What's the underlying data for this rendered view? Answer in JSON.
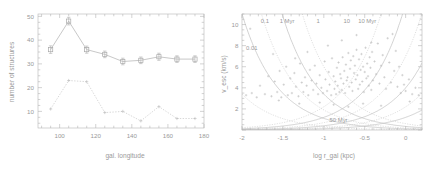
{
  "figure": {
    "background": "#ffffff",
    "line_color": "#b0b0b0",
    "text_color": "#9a9a9a"
  },
  "chart_data": [
    {
      "type": "line",
      "panel": "left",
      "title": "",
      "xlabel": "gal. longitude",
      "ylabel": "number of structures",
      "xlim": [
        88,
        180
      ],
      "ylim": [
        3,
        51
      ],
      "xticks": [
        100,
        120,
        140,
        160,
        180
      ],
      "yticks": [
        10,
        20,
        30,
        40,
        50
      ],
      "grid": false,
      "legend": "none",
      "series": [
        {
          "name": "all structures",
          "marker": "square",
          "linestyle": "solid",
          "x": [
            95,
            105,
            115,
            125,
            135,
            145,
            155,
            165,
            175
          ],
          "values": [
            36,
            48,
            36,
            34,
            31,
            31.5,
            33,
            32,
            32
          ],
          "yerr": [
            1.6,
            1.6,
            1.5,
            1.4,
            1.4,
            1.4,
            1.5,
            1.4,
            1.4
          ]
        },
        {
          "name": "subset",
          "marker": "plus",
          "linestyle": "dotted",
          "x": [
            95,
            105,
            115,
            125,
            135,
            145,
            155,
            165,
            175
          ],
          "values": [
            11,
            23,
            22.5,
            9.5,
            10,
            6,
            12,
            7,
            7
          ],
          "yerr": [
            0,
            0,
            0,
            0,
            0,
            0,
            0,
            0,
            0
          ]
        }
      ]
    },
    {
      "type": "scatter",
      "panel": "right",
      "title": "",
      "xlabel": "log r_gal (kpc)",
      "ylabel": "v_esc (km/s)",
      "xlim": [
        -2.0,
        0.2
      ],
      "ylim": [
        0,
        11
      ],
      "xticks": [
        -2,
        -1.5,
        -1,
        -0.5,
        0
      ],
      "yticks": [
        2,
        4,
        6,
        8,
        10
      ],
      "grid": false,
      "legend": "none",
      "annotations": [
        {
          "text": "0.1",
          "x": -1.72,
          "y": 10.1
        },
        {
          "text": "1 Myr",
          "x": -1.45,
          "y": 10.1
        },
        {
          "text": "1",
          "x": -1.07,
          "y": 10.1
        },
        {
          "text": "10",
          "x": -0.72,
          "y": 10.1
        },
        {
          "text": "10 Myr",
          "x": -0.47,
          "y": 10.1
        },
        {
          "text": "0.01",
          "x": -1.88,
          "y": 7.6
        },
        {
          "text": "50 Myr",
          "x": -0.82,
          "y": 0.75
        }
      ],
      "curve_labels": [
        "0.01",
        "0.1",
        "1 Myr",
        "1",
        "10",
        "10 Myr",
        "50 Myr"
      ],
      "points": [
        [
          -1.95,
          3.3
        ],
        [
          -1.88,
          3.5
        ],
        [
          -1.82,
          3.1
        ],
        [
          -1.78,
          4.2
        ],
        [
          -1.72,
          3.4
        ],
        [
          -1.68,
          5.1
        ],
        [
          -1.64,
          3.2
        ],
        [
          -1.6,
          4.6
        ],
        [
          -1.57,
          3.6
        ],
        [
          -1.54,
          5.6
        ],
        [
          -1.52,
          3.1
        ],
        [
          -1.49,
          4.3
        ],
        [
          -1.46,
          6.0
        ],
        [
          -1.44,
          3.3
        ],
        [
          -1.41,
          4.9
        ],
        [
          -1.39,
          3.5
        ],
        [
          -1.36,
          5.4
        ],
        [
          -1.34,
          4.1
        ],
        [
          -1.31,
          3.2
        ],
        [
          -1.29,
          6.3
        ],
        [
          -1.27,
          4.5
        ],
        [
          -1.25,
          3.6
        ],
        [
          -1.23,
          5.0
        ],
        [
          -1.21,
          4.2
        ],
        [
          -1.19,
          3.3
        ],
        [
          -1.17,
          5.7
        ],
        [
          -1.15,
          4.7
        ],
        [
          -1.13,
          3.8
        ],
        [
          -1.11,
          6.1
        ],
        [
          -1.09,
          4.4
        ],
        [
          -1.07,
          3.4
        ],
        [
          -1.05,
          5.2
        ],
        [
          -1.03,
          4.0
        ],
        [
          -1.01,
          3.5
        ],
        [
          -0.99,
          6.5
        ],
        [
          -0.98,
          4.8
        ],
        [
          -0.96,
          3.7
        ],
        [
          -0.94,
          5.5
        ],
        [
          -0.93,
          4.3
        ],
        [
          -0.91,
          3.3
        ],
        [
          -0.9,
          6.8
        ],
        [
          -0.88,
          5.1
        ],
        [
          -0.87,
          3.9
        ],
        [
          -0.86,
          4.6
        ],
        [
          -0.85,
          3.4
        ],
        [
          -0.84,
          5.9
        ],
        [
          -0.83,
          4.2
        ],
        [
          -0.82,
          6.4
        ],
        [
          -0.81,
          3.6
        ],
        [
          -0.8,
          5.3
        ],
        [
          -0.79,
          4.9
        ],
        [
          -0.78,
          3.8
        ],
        [
          -0.77,
          6.9
        ],
        [
          -0.76,
          4.4
        ],
        [
          -0.75,
          5.6
        ],
        [
          -0.74,
          3.5
        ],
        [
          -0.73,
          6.2
        ],
        [
          -0.72,
          4.7
        ],
        [
          -0.71,
          5.0
        ],
        [
          -0.7,
          7.3
        ],
        [
          -0.69,
          4.1
        ],
        [
          -0.68,
          5.8
        ],
        [
          -0.67,
          6.6
        ],
        [
          -0.66,
          4.5
        ],
        [
          -0.65,
          3.7
        ],
        [
          -0.64,
          7.0
        ],
        [
          -0.63,
          5.4
        ],
        [
          -0.62,
          6.1
        ],
        [
          -0.61,
          4.8
        ],
        [
          -0.6,
          7.6
        ],
        [
          -0.59,
          5.2
        ],
        [
          -0.58,
          3.9
        ],
        [
          -0.57,
          6.7
        ],
        [
          -0.56,
          4.3
        ],
        [
          -0.55,
          5.7
        ],
        [
          -0.54,
          7.2
        ],
        [
          -0.53,
          4.6
        ],
        [
          -0.52,
          6.0
        ],
        [
          -0.51,
          3.6
        ],
        [
          -0.5,
          5.5
        ],
        [
          -0.49,
          7.8
        ],
        [
          -0.48,
          4.9
        ],
        [
          -0.47,
          6.3
        ],
        [
          -0.46,
          5.1
        ],
        [
          -0.45,
          4.2
        ],
        [
          -0.44,
          6.9
        ],
        [
          -0.43,
          5.9
        ],
        [
          -0.42,
          3.8
        ],
        [
          -0.41,
          7.4
        ],
        [
          -0.4,
          4.7
        ],
        [
          -0.38,
          6.5
        ],
        [
          -0.36,
          5.3
        ],
        [
          -0.34,
          8.2
        ],
        [
          -0.32,
          4.4
        ],
        [
          -0.3,
          6.1
        ],
        [
          -0.28,
          7.1
        ],
        [
          -0.26,
          5.0
        ],
        [
          -0.24,
          3.9
        ],
        [
          -0.22,
          8.7
        ],
        [
          -0.2,
          6.4
        ],
        [
          -0.18,
          4.5
        ],
        [
          -0.16,
          9.1
        ],
        [
          -0.14,
          5.6
        ],
        [
          -0.12,
          7.5
        ],
        [
          -0.1,
          4.1
        ],
        [
          -0.08,
          6.0
        ],
        [
          -0.06,
          3.5
        ],
        [
          -0.04,
          5.2
        ],
        [
          -0.02,
          4.3
        ],
        [
          0.0,
          3.7
        ],
        [
          0.04,
          4.8
        ],
        [
          0.08,
          3.4
        ],
        [
          0.12,
          4.0
        ],
        [
          0.16,
          3.3
        ],
        [
          -1.9,
          9.6
        ],
        [
          -1.62,
          7.2
        ],
        [
          -1.35,
          6.8
        ],
        [
          -1.2,
          7.4
        ],
        [
          -0.95,
          8.0
        ],
        [
          -0.78,
          8.5
        ],
        [
          -0.6,
          9.0
        ],
        [
          -0.42,
          8.3
        ],
        [
          -1.05,
          2.6
        ],
        [
          -0.88,
          2.4
        ],
        [
          -0.7,
          2.2
        ],
        [
          -0.52,
          2.5
        ],
        [
          -0.3,
          2.3
        ],
        [
          -1.55,
          2.8
        ],
        [
          -1.3,
          2.5
        ],
        [
          0.05,
          2.7
        ]
      ]
    }
  ]
}
